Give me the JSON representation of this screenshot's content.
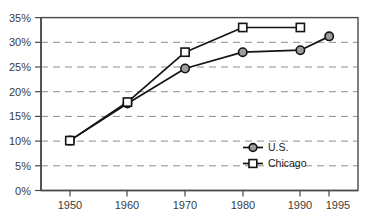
{
  "chart_data": {
    "type": "line",
    "title": "",
    "xlabel": "",
    "ylabel": "",
    "x": [
      1950,
      1960,
      1970,
      1980,
      1990,
      1995
    ],
    "categories": [
      "1950",
      "1960",
      "1970",
      "1980",
      "1990",
      "1995"
    ],
    "xtick_labels": [
      "1950",
      "1960",
      "1970",
      "1980",
      "1990",
      "1995"
    ],
    "ytick_labels": [
      "0%",
      "5%",
      "10%",
      "15%",
      "20%",
      "25%",
      "30%",
      "35%"
    ],
    "ytick_values": [
      0,
      5,
      10,
      15,
      20,
      25,
      30,
      35
    ],
    "ylim": [
      0,
      35
    ],
    "xlim": [
      1945,
      2000
    ],
    "grid": "horizontal-dashed",
    "legend_position": "inside-lower-right",
    "series": [
      {
        "name": "U.S.",
        "marker": "circle",
        "marker_fill": "#9c9c9c",
        "x": [
          1950,
          1960,
          1970,
          1980,
          1990,
          1995
        ],
        "values": [
          10.1,
          17.6,
          24.7,
          28.0,
          28.4,
          31.2
        ]
      },
      {
        "name": "Chicago",
        "marker": "square",
        "marker_fill": "#ffffff",
        "x": [
          1950,
          1960,
          1970,
          1980,
          1990
        ],
        "values": [
          10.1,
          17.9,
          28.0,
          33.0,
          33.0
        ]
      }
    ]
  },
  "legend": {
    "entries": [
      {
        "label": "U.S."
      },
      {
        "label": "Chicago"
      }
    ]
  },
  "colors": {
    "line": "#141414",
    "grid": "#8d8d8d",
    "frame": "#4a4a4a",
    "text": "#3b3b3b",
    "us_marker": "#9c9c9c",
    "chicago_marker": "#ffffff",
    "background": "#ffffff"
  }
}
